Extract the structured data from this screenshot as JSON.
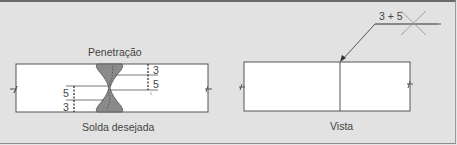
{
  "left_figure": {
    "title_top": "Penetração",
    "title_bottom": "Solda desejada",
    "dims_right": [
      "3",
      "5"
    ],
    "dims_left": [
      "5",
      "3"
    ]
  },
  "right_figure": {
    "caption": "Vista",
    "weld_symbol_text": "3 + 5"
  },
  "colors": {
    "background": "#e2e2e2",
    "plate": "#ffffff",
    "weld": "#8a8a8a",
    "line": "#555555"
  }
}
